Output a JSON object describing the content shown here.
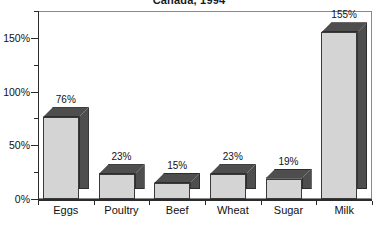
{
  "chart_data": {
    "type": "bar",
    "title": "Canada, 1994",
    "xlabel": "",
    "ylabel": "",
    "categories": [
      "Eggs",
      "Poultry",
      "Beef",
      "Wheat",
      "Sugar",
      "Milk"
    ],
    "values": [
      76,
      23,
      15,
      23,
      19,
      155
    ],
    "value_labels": [
      "76%",
      "23%",
      "15%",
      "23%",
      "19%",
      "155%"
    ],
    "unit": "%",
    "ylim": [
      0,
      175
    ],
    "ytick_values": [
      0,
      50,
      100,
      150
    ],
    "ytick_labels": [
      "0%",
      "50%",
      "100%",
      "150%"
    ],
    "yminor_values": [
      25,
      75,
      125,
      175
    ],
    "grid": false,
    "legend": false,
    "style": "3d-bar",
    "colors": {
      "bar_front": "#d4d4d4",
      "bar_side": "#4e4e4e",
      "bar_top": "#4e4e4e",
      "axis": "#2b2b2b",
      "frame": "#8a8a8a",
      "text": "#111111",
      "background": "#ffffff"
    }
  }
}
